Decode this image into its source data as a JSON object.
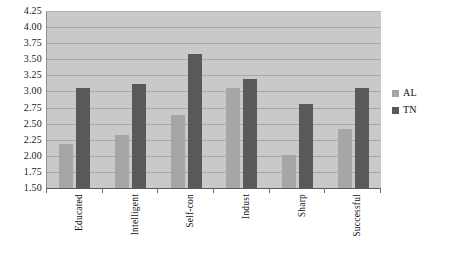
{
  "chart_data": {
    "type": "bar",
    "title": "",
    "xlabel": "",
    "ylabel": "",
    "categories": [
      "Educated",
      "Intelligent",
      "Self-con",
      "Indust",
      "Sharp",
      "Successful"
    ],
    "series": [
      {
        "name": "AL",
        "color": "#a6a6a6",
        "values": [
          2.19,
          2.33,
          2.63,
          3.05,
          2.01,
          2.42
        ]
      },
      {
        "name": "TN",
        "color": "#595959",
        "values": [
          3.06,
          3.12,
          3.58,
          3.19,
          2.8,
          3.06
        ]
      }
    ],
    "ylim": [
      1.5,
      4.25
    ],
    "ytick_step": 0.25,
    "yticks": [
      "4.25",
      "4.00",
      "3.75",
      "3.50",
      "3.25",
      "3.00",
      "2.75",
      "2.50",
      "2.25",
      "2.00",
      "1.75",
      "1.50"
    ],
    "grid": true,
    "legend_position": "right",
    "plot_background": "#c9c9c9",
    "gridline_color": "#a8a8a8"
  }
}
